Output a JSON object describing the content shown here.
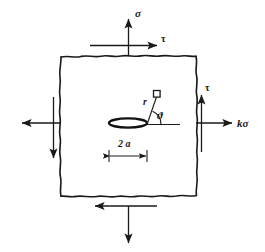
{
  "figure": {
    "type": "mechanics-free-body-diagram",
    "background_color": "#ffffff",
    "line_color": "#1a1a1a"
  },
  "labels": {
    "top_normal_stress": "σ",
    "top_shear_stress": "τ",
    "right_shear_stress": "τ",
    "right_normal_stress": "kσ",
    "radius": "r",
    "angle": "ϑ",
    "crack_length": "2 a"
  },
  "elements": {
    "body_outline": "hand-drawn wavy square",
    "crack": "flat ellipse (center crack)",
    "crack_axis_line": "horizontal reference line through crack",
    "field_point_marker": "small open square at radius r",
    "dimension_line": "2a width dimension with end ticks"
  },
  "arrows": [
    {
      "name": "top-sigma-arrow",
      "direction": "up",
      "label": "σ",
      "location": "top-center"
    },
    {
      "name": "top-tau-arrow",
      "direction": "right",
      "label": "τ",
      "location": "top-edge"
    },
    {
      "name": "right-tau-arrow",
      "direction": "up",
      "label": "τ",
      "location": "right-edge"
    },
    {
      "name": "right-ksigma-arrow",
      "direction": "right",
      "label": "kσ",
      "location": "right-center"
    },
    {
      "name": "left-ksigma-arrow",
      "direction": "left",
      "label": "",
      "location": "left-center"
    },
    {
      "name": "left-tau-arrow",
      "direction": "down",
      "label": "",
      "location": "left-edge"
    },
    {
      "name": "bottom-tau-arrow",
      "direction": "left",
      "label": "",
      "location": "bottom-edge"
    },
    {
      "name": "bottom-sigma-arrow",
      "direction": "down",
      "label": "",
      "location": "bottom-center"
    }
  ]
}
